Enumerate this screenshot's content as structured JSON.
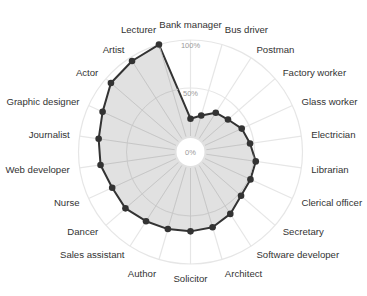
{
  "chart_data": {
    "type": "radar",
    "title": "",
    "categories": [
      "Bank manager",
      "Bus driver",
      "Postman",
      "Factory worker",
      "Glass worker",
      "Electrician",
      "Librarian",
      "Clerical officer",
      "Secretary",
      "Software developer",
      "Architect",
      "Solicitor",
      "Author",
      "Sales assistant",
      "Dancer",
      "Nurse",
      "Web developer",
      "Journalist",
      "Graphic designer",
      "Actor",
      "Artist",
      "Lecturer"
    ],
    "series": [
      {
        "name": "",
        "values": [
          18,
          23,
          32,
          35,
          42,
          46,
          52,
          52,
          53,
          60,
          65,
          66,
          67,
          69,
          73,
          73,
          78,
          80,
          84,
          93,
          96,
          100
        ]
      }
    ],
    "radial_ticks": [
      "0%",
      "50%",
      "100%"
    ],
    "radial_tick_values": [
      0,
      50,
      100
    ],
    "rlim": [
      0,
      100
    ],
    "grid": true,
    "legend": "none",
    "colors": {
      "line": "#333333",
      "fill": "#dcdcdc",
      "grid": "#e6e6e6",
      "marker": "#333333"
    }
  }
}
